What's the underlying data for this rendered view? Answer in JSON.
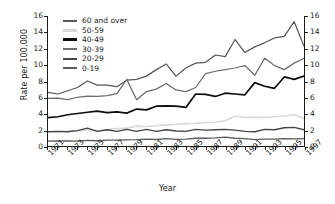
{
  "chart_data": {
    "type": "line",
    "title": "",
    "xlabel": "Year",
    "ylabel": "Rate per 100,000",
    "xlim": [
      1971,
      1997
    ],
    "ylim": [
      0,
      16
    ],
    "grid": false,
    "legend_position": "top-left",
    "dual_y_axis": true,
    "x": [
      1971,
      1972,
      1973,
      1974,
      1975,
      1976,
      1977,
      1978,
      1979,
      1980,
      1981,
      1982,
      1983,
      1984,
      1985,
      1986,
      1987,
      1988,
      1989,
      1990,
      1991,
      1992,
      1993,
      1994,
      1995,
      1996,
      1997
    ],
    "xtick_labels": [
      "1971",
      "1973",
      "1975",
      "1977",
      "1979",
      "1981",
      "1983",
      "1985",
      "1987",
      "1989",
      "1991",
      "1993",
      "1995",
      "1997"
    ],
    "ytick_labels": [
      "0",
      "2",
      "4",
      "6",
      "8",
      "10",
      "12",
      "14",
      "16"
    ],
    "ytick_labels_right": [
      "0",
      "2",
      "4",
      "6",
      "8",
      "10",
      "12",
      "14",
      "16"
    ],
    "series": [
      {
        "name": "60 and over",
        "color": "#575757",
        "width": 1.25,
        "values": [
          6.6,
          6.4,
          6.8,
          7.2,
          8.0,
          7.5,
          7.5,
          7.3,
          8.1,
          8.2,
          8.6,
          9.4,
          10.1,
          8.6,
          9.6,
          10.2,
          10.3,
          11.2,
          11.0,
          13.1,
          11.5,
          12.2,
          12.7,
          13.3,
          13.5,
          15.3,
          12.3
        ]
      },
      {
        "name": "50-59",
        "color": "#d9d9d9",
        "width": 1.6,
        "values": [
          1.75,
          1.75,
          1.8,
          1.9,
          1.95,
          1.9,
          2.0,
          2.15,
          2.2,
          2.45,
          2.4,
          2.5,
          2.6,
          2.65,
          2.75,
          2.8,
          2.9,
          2.95,
          3.1,
          3.7,
          3.5,
          3.55,
          3.5,
          3.6,
          3.7,
          3.85,
          3.35
        ]
      },
      {
        "name": "40-49",
        "color": "#0d0d0d",
        "width": 1.7,
        "values": [
          3.5,
          3.6,
          3.85,
          4.0,
          4.15,
          4.3,
          4.1,
          4.2,
          4.05,
          4.55,
          4.45,
          4.9,
          4.95,
          4.9,
          4.75,
          6.4,
          6.35,
          6.1,
          6.5,
          6.4,
          6.3,
          7.8,
          7.35,
          7.1,
          8.5,
          8.2,
          8.6
        ]
      },
      {
        "name": "30-39",
        "color": "#6e6e6e",
        "width": 1.25,
        "values": [
          5.85,
          5.9,
          5.7,
          6.0,
          6.15,
          6.1,
          6.2,
          6.45,
          8.2,
          5.7,
          6.7,
          7.0,
          7.7,
          6.9,
          6.7,
          7.2,
          8.9,
          9.2,
          9.4,
          9.6,
          9.9,
          8.7,
          10.8,
          9.9,
          9.4,
          10.2,
          10.8
        ]
      },
      {
        "name": "20-29",
        "color": "#464646",
        "width": 1.35,
        "values": [
          1.75,
          1.8,
          1.75,
          1.9,
          2.2,
          1.8,
          2.0,
          1.8,
          2.05,
          1.8,
          2.05,
          1.8,
          2.0,
          1.85,
          1.8,
          2.05,
          1.95,
          2.0,
          2.05,
          1.95,
          1.8,
          1.75,
          2.05,
          2.0,
          2.25,
          2.3,
          2.0
        ]
      },
      {
        "name": "0-19",
        "color": "#5c5c5c",
        "width": 1.35,
        "values": [
          0.6,
          0.62,
          0.62,
          0.6,
          0.7,
          0.65,
          0.72,
          0.72,
          0.75,
          0.78,
          0.85,
          0.8,
          0.9,
          0.82,
          0.85,
          0.95,
          0.95,
          1.0,
          1.1,
          0.95,
          0.9,
          0.78,
          0.85,
          0.85,
          0.9,
          0.88,
          0.9
        ]
      }
    ]
  },
  "legend": {
    "items": [
      {
        "label": "60 and over"
      },
      {
        "label": "50-59"
      },
      {
        "label": "40-49"
      },
      {
        "label": "30-39"
      },
      {
        "label": "20-29"
      },
      {
        "label": "0-19"
      }
    ]
  }
}
